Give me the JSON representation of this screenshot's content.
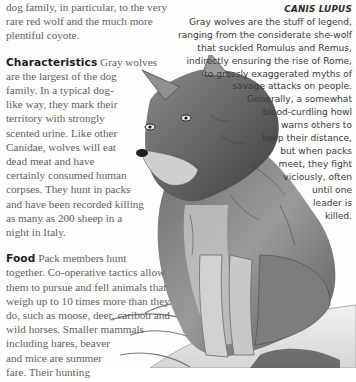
{
  "article": {
    "intro": {
      "lines": [
        "dog family, in particular, to the very",
        "rare red wolf and the much more",
        "plentiful coyote."
      ]
    },
    "characteristics": {
      "heading": "Characteristics",
      "lines": [
        "Gray wolves",
        "are the largest of the dog",
        "family. In a typical dog-",
        "like way, they mark their",
        "territory with strongly",
        "scented urine. Like other",
        "Canidae, wolves will eat",
        "dead meat and have",
        "certainly consumed human",
        "corpses. They hunt in packs",
        "and have been recorded killing",
        "as many as 200 sheep in a",
        "night in Italy."
      ]
    },
    "food": {
      "heading": "Food",
      "lines": [
        "Pack members hunt",
        "together. Co-operative tactics allow",
        "them to pursue and fell animals that",
        "weigh up to 10 times more than they",
        "do, such as moose, deer, caribou and",
        "wild horses. Smaller mammals",
        "including hares, beaver",
        "and mice are summer",
        "fare. Their hunting"
      ]
    }
  },
  "caption": {
    "title": "CANIS LUPUS",
    "lines": [
      "Gray wolves are the stuff of legend,",
      "ranging from the considerate she-wolf",
      "that suckled Romulus and Remus,",
      "indirectly ensuring the rise of Rome,",
      "to grossly exaggerated myths of",
      "savage attacks on people.",
      "Generally, a somewhat",
      "blood-curdling howl",
      "warns others to",
      "keep their distance,",
      "but when packs",
      "meet, they fight",
      "viciously, often",
      "until one",
      "leader is",
      "killed."
    ]
  },
  "illustration": {
    "subject": "gray-wolf-sitting-on-rock",
    "colors": {
      "fur_dark": "#3c3c3c",
      "fur_mid": "#8a8a8a",
      "fur_light": "#d8d8d8",
      "rock": "#e9e9e9"
    }
  }
}
